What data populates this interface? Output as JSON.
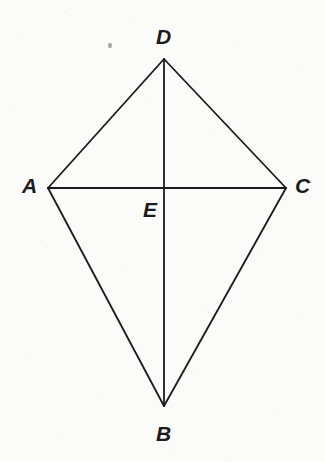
{
  "figure": {
    "name": "kite-quadrilateral-diagram",
    "background_color": "#fbfbf9",
    "stroke_color": "#1b1b1b",
    "stroke_width": 1.8,
    "canvas": {
      "width": 325,
      "height": 462
    },
    "points": {
      "A": {
        "x": 48,
        "y": 188
      },
      "B": {
        "x": 164,
        "y": 406
      },
      "C": {
        "x": 286,
        "y": 188
      },
      "D": {
        "x": 164,
        "y": 59
      },
      "E": {
        "x": 164,
        "y": 188
      }
    },
    "segments": [
      {
        "name": "side-AD",
        "from": "A",
        "to": "D"
      },
      {
        "name": "side-DC",
        "from": "D",
        "to": "C"
      },
      {
        "name": "side-CB",
        "from": "C",
        "to": "B"
      },
      {
        "name": "side-BA",
        "from": "B",
        "to": "A"
      },
      {
        "name": "diagonal-AC",
        "from": "A",
        "to": "C"
      },
      {
        "name": "diagonal-DB",
        "from": "D",
        "to": "B"
      }
    ],
    "labels": [
      {
        "name": "vertex-label-D",
        "text": "D",
        "x": 156,
        "y": 26,
        "align": "left"
      },
      {
        "name": "vertex-label-A",
        "text": "A",
        "x": 22,
        "y": 175,
        "align": "left"
      },
      {
        "name": "vertex-label-C",
        "text": "C",
        "x": 295,
        "y": 175,
        "align": "left"
      },
      {
        "name": "vertex-label-E",
        "text": "E",
        "x": 143,
        "y": 199,
        "align": "left"
      },
      {
        "name": "vertex-label-B",
        "text": "B",
        "x": 156,
        "y": 423,
        "align": "left"
      }
    ],
    "artifacts": [
      {
        "name": "scan-speck",
        "x": 108,
        "y": 43,
        "width": 4,
        "height": 5
      }
    ]
  }
}
